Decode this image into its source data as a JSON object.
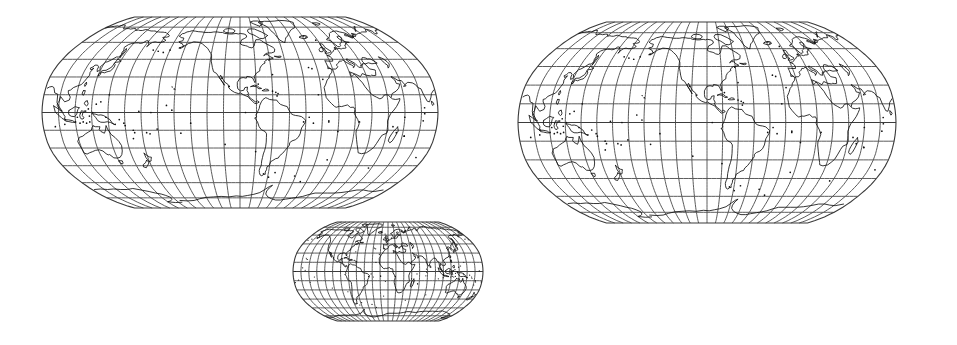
{
  "figure": {
    "background_color": "#ffffff",
    "width": 957,
    "height": 345,
    "panel_count": 3
  },
  "style": {
    "graticule_color": "#4a4a4a",
    "coastline_color": "#111111",
    "outline_color": "#3a3a3a",
    "background_color": "#ffffff"
  },
  "chart_data": {
    "type": "map",
    "projection": "pseudocylindrical (Robinson / Winkel-Tripel style, pointed-to-short pole line)",
    "graticule": {
      "meridian_interval_deg": 15,
      "parallel_interval_deg": 15,
      "meridian_count": 24,
      "parallel_count": 11,
      "lat_range": [
        -90,
        90
      ],
      "lon_range": [
        -180,
        180
      ],
      "grid": "on",
      "equator_emphasized": true
    },
    "panels": [
      {
        "id": "map-left",
        "label": "Left world map",
        "central_meridian_deg": -95,
        "x": 42,
        "y": 17,
        "width": 396,
        "height": 191,
        "scale": "large",
        "aspect_ratio": 2.07
      },
      {
        "id": "map-right",
        "label": "Right world map",
        "central_meridian_deg": -95,
        "x": 518,
        "y": 22,
        "width": 378,
        "height": 201,
        "scale": "large",
        "aspect_ratio": 1.88
      },
      {
        "id": "map-small",
        "label": "Small world map",
        "central_meridian_deg": 0,
        "x": 293,
        "y": 222,
        "width": 190,
        "height": 99,
        "scale": "small",
        "aspect_ratio": 1.92
      }
    ],
    "legend": "none",
    "axis_labels": "none",
    "tick_labels": "none",
    "annotations": []
  }
}
